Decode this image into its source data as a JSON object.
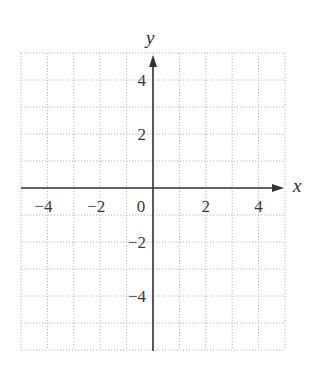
{
  "chart_data": {
    "type": "coordinate_grid",
    "title": "",
    "xlabel": "x",
    "ylabel": "y",
    "xlim": [
      -5,
      5
    ],
    "ylim": [
      -6,
      5
    ],
    "grid": true,
    "grid_style": "dotted",
    "grid_step": 1,
    "x_ticks": [
      {
        "value": -4,
        "label": "−4"
      },
      {
        "value": -2,
        "label": "−2"
      },
      {
        "value": 0,
        "label": "0"
      },
      {
        "value": 2,
        "label": "2"
      },
      {
        "value": 4,
        "label": "4"
      }
    ],
    "y_ticks": [
      {
        "value": 4,
        "label": "4"
      },
      {
        "value": 2,
        "label": "2"
      },
      {
        "value": -2,
        "label": "−2"
      },
      {
        "value": -4,
        "label": "−4"
      }
    ],
    "series": []
  },
  "colors": {
    "axis": "#333333",
    "grid": "#b5b5b5",
    "text": "#3a3a3a"
  }
}
